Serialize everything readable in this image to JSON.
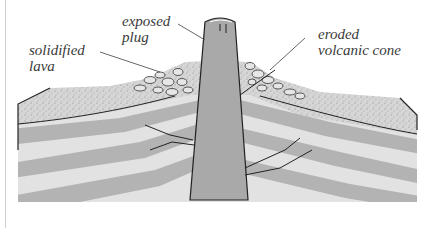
{
  "diagram": {
    "labels": {
      "exposed_plug": "exposed\nplug",
      "solidified_lava": "solidified\nlava",
      "eroded_cone": "eroded\nvolcanic cone"
    },
    "colors": {
      "plug_fill": "#a9a9a9",
      "band_dark": "#b3b3b3",
      "band_light": "#e2e2e2",
      "outline": "#222222",
      "label_text": "#3a3a3a",
      "leader_line": "#555555"
    }
  }
}
